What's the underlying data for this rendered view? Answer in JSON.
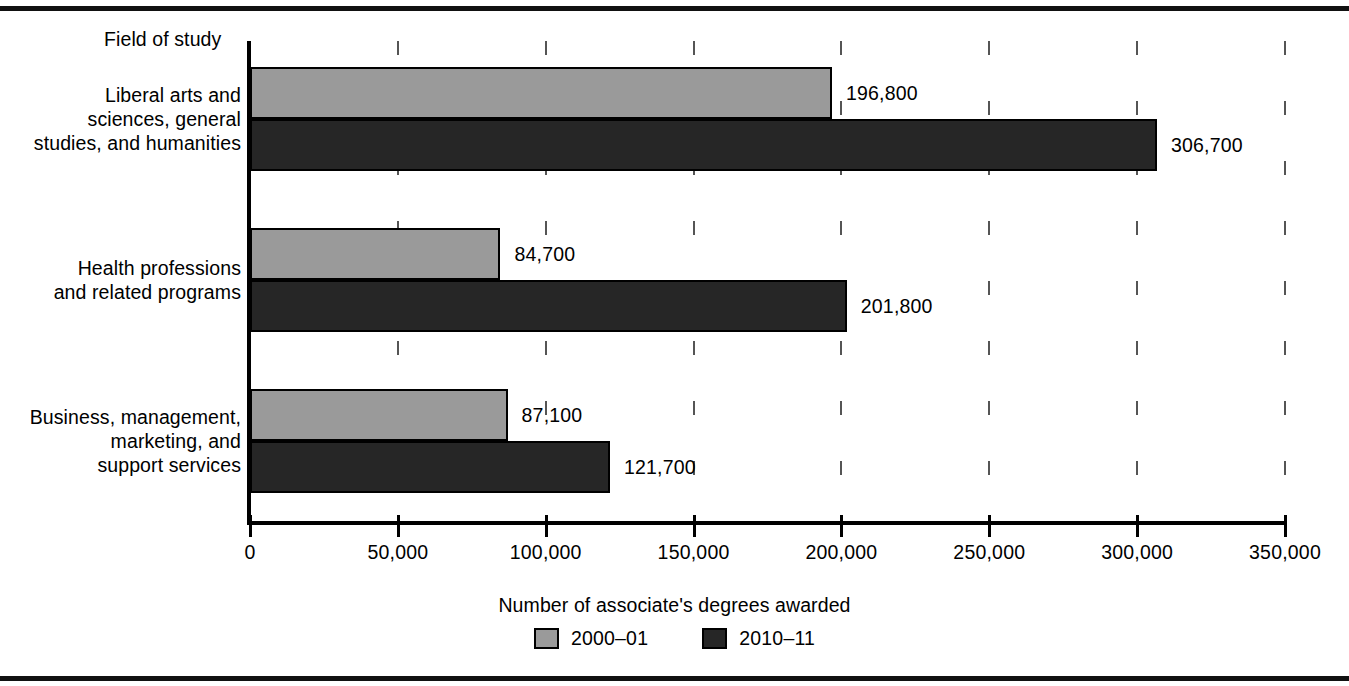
{
  "chart_data": {
    "type": "bar",
    "orientation": "horizontal",
    "title": "",
    "xlabel": "Number of associate's degrees awarded",
    "ylabel": "Field of study",
    "xlim": [
      0,
      350000
    ],
    "xticks": [
      0,
      50000,
      100000,
      150000,
      200000,
      250000,
      300000,
      350000
    ],
    "xtick_labels": [
      "0",
      "50,000",
      "100,000",
      "150,000",
      "200,000",
      "250,000",
      "300,000",
      "350,000"
    ],
    "grid": "vertical-dashed",
    "legend_position": "bottom-center",
    "categories": [
      "Liberal arts and\nsciences, general\nstudies, and humanities",
      "Health professions\nand related programs",
      "Business, management,\nmarketing, and\nsupport services"
    ],
    "series": [
      {
        "name": "2000–01",
        "color": "#9a9a9a",
        "values": [
          196800,
          84700,
          87100
        ],
        "value_labels": [
          "196,800",
          "84,700",
          "87,100"
        ]
      },
      {
        "name": "2010–11",
        "color": "#262626",
        "values": [
          306700,
          201800,
          121700
        ],
        "value_labels": [
          "306,700",
          "201,800",
          "121,700"
        ]
      }
    ]
  },
  "axis": {
    "y_title": "Field of study",
    "x_title": "Number of associate's degrees awarded"
  },
  "legend": {
    "items": [
      {
        "label": "2000–01",
        "color": "#9a9a9a"
      },
      {
        "label": "2010–11",
        "color": "#262626"
      }
    ]
  }
}
